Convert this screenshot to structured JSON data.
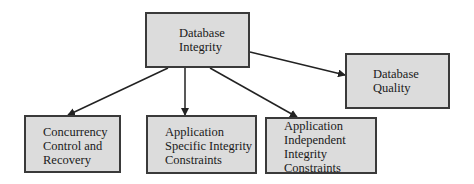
{
  "diagram": {
    "type": "hierarchy",
    "colors": {
      "node_fill": "#dcdcdc",
      "node_border": "#3a3a3a",
      "edge": "#222222",
      "text": "#1a1a1a"
    },
    "nodes": [
      {
        "id": "database-integrity",
        "label": "Database\nIntegrity",
        "box": [
          145,
          12,
          105,
          56
        ],
        "text_at": [
          32,
          12
        ]
      },
      {
        "id": "database-quality",
        "label": "Database\nQuality",
        "box": [
          345,
          53,
          105,
          56
        ],
        "text_at": [
          26,
          12
        ]
      },
      {
        "id": "concurrency-control",
        "label": "Concurrency\nControl and\nRecovery",
        "box": [
          24,
          115,
          97,
          58
        ],
        "text_at": [
          17,
          8
        ]
      },
      {
        "id": "application-specific",
        "label": "Application\nSpecific Integrity\nConstraints",
        "box": [
          146,
          115,
          111,
          59
        ],
        "text_at": [
          17,
          8
        ]
      },
      {
        "id": "application-independent",
        "label": "Application\nIndependent\nIntegrity\nConstraints",
        "box": [
          265,
          117,
          112,
          57
        ],
        "text_at": [
          17,
          0
        ]
      }
    ],
    "edges": [
      {
        "from": "database-integrity",
        "to": "concurrency-control",
        "points": [
          168,
          68,
          68,
          115
        ]
      },
      {
        "from": "database-integrity",
        "to": "application-specific",
        "points": [
          185,
          68,
          185,
          115
        ]
      },
      {
        "from": "database-integrity",
        "to": "application-independent",
        "points": [
          210,
          68,
          297,
          117
        ]
      },
      {
        "from": "database-integrity",
        "to": "database-quality",
        "points": [
          250,
          52,
          345,
          75
        ]
      }
    ]
  }
}
